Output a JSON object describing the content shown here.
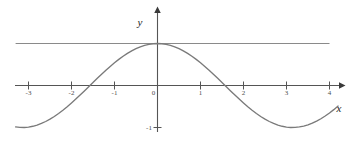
{
  "figure": {
    "background_color": "#ffffff",
    "width": 356,
    "height": 146
  },
  "axes": {
    "x_axis_label": "x",
    "y_axis_label": "y",
    "axis_color": "#555555",
    "x_tick_labels": [
      "-3",
      "-2",
      "-1",
      "0",
      "1",
      "2",
      "3",
      "4"
    ],
    "y_tick_labels": [
      "-1"
    ],
    "origin_label": "0"
  },
  "chart_data": {
    "type": "line",
    "title": "",
    "xlabel": "x",
    "ylabel": "y",
    "xlim": [
      -3.3,
      4.4
    ],
    "ylim": [
      -1.15,
      1.55
    ],
    "grid": false,
    "legend": "none",
    "xticks": [
      -3,
      -2,
      -1,
      0,
      1,
      2,
      3,
      4
    ],
    "yticks": [
      -1
    ],
    "series": [
      {
        "name": "y = cos(x)",
        "type": "line",
        "color": "#7a7a7a",
        "x": [
          -3.3,
          -3.2,
          -3.1,
          -3.0,
          -2.9,
          -2.8,
          -2.7,
          -2.6,
          -2.5,
          -2.4,
          -2.3,
          -2.2,
          -2.1,
          -2.0,
          -1.9,
          -1.8,
          -1.7,
          -1.6,
          -1.5,
          -1.4,
          -1.3,
          -1.2,
          -1.1,
          -1.0,
          -0.9,
          -0.8,
          -0.7,
          -0.6,
          -0.5,
          -0.4,
          -0.3,
          -0.2,
          -0.1,
          0.0,
          0.1,
          0.2,
          0.3,
          0.4,
          0.5,
          0.6,
          0.7,
          0.8,
          0.9,
          1.0,
          1.1,
          1.2,
          1.3,
          1.4,
          1.5,
          1.6,
          1.7,
          1.8,
          1.9,
          2.0,
          2.1,
          2.2,
          2.3,
          2.4,
          2.5,
          2.6,
          2.7,
          2.8,
          2.9,
          3.0,
          3.1,
          3.2,
          3.3,
          3.4,
          3.5,
          3.6,
          3.7,
          3.8,
          3.9,
          4.0,
          4.1,
          4.2
        ],
        "y": [
          -0.987,
          -0.998,
          -1.0,
          -0.99,
          -0.971,
          -0.942,
          -0.904,
          -0.857,
          -0.801,
          -0.737,
          -0.666,
          -0.589,
          -0.505,
          -0.416,
          -0.323,
          -0.227,
          -0.129,
          -0.029,
          0.071,
          0.17,
          0.268,
          0.362,
          0.454,
          0.54,
          0.622,
          0.697,
          0.765,
          0.825,
          0.878,
          0.921,
          0.955,
          0.98,
          0.995,
          1.0,
          0.995,
          0.98,
          0.955,
          0.921,
          0.878,
          0.825,
          0.765,
          0.697,
          0.622,
          0.54,
          0.454,
          0.362,
          0.268,
          0.17,
          0.071,
          -0.029,
          -0.129,
          -0.227,
          -0.323,
          -0.416,
          -0.505,
          -0.589,
          -0.666,
          -0.737,
          -0.801,
          -0.857,
          -0.904,
          -0.942,
          -0.971,
          -0.99,
          -1.0,
          -0.998,
          -0.987,
          -0.967,
          -0.936,
          -0.897,
          -0.848,
          -0.791,
          -0.726,
          -0.654,
          -0.575,
          -0.49
        ],
        "peak": {
          "x": 0,
          "y": 1
        },
        "troughs": [
          {
            "x": -3.14159,
            "y": -1
          },
          {
            "x": 3.14159,
            "y": -1
          }
        ],
        "zero_crossings": [
          -1.5708,
          1.5708
        ]
      },
      {
        "name": "y = 1",
        "type": "line",
        "color": "#8a8a8a",
        "constant_y": 1,
        "x_start": -3.3,
        "x_end": 4.0
      }
    ]
  }
}
